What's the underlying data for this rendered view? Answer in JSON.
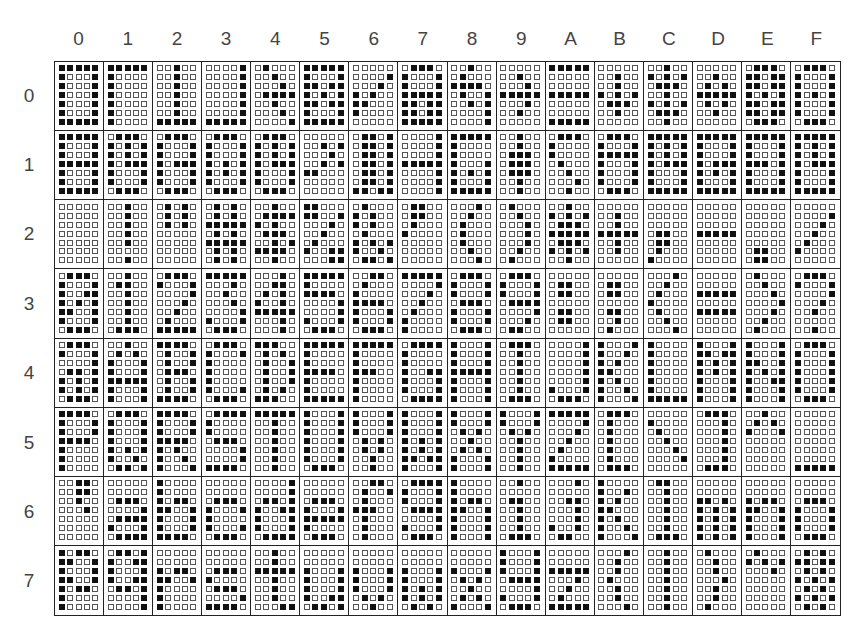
{
  "column_headers": [
    "0",
    "1",
    "2",
    "3",
    "4",
    "5",
    "6",
    "7",
    "8",
    "9",
    "A",
    "B",
    "C",
    "D",
    "E",
    "F"
  ],
  "row_headers": [
    "0",
    "1",
    "2",
    "3",
    "4",
    "5",
    "6",
    "7"
  ],
  "colors": {
    "dot_on": "#111111",
    "dot_off": "#ffffff",
    "grid_line": "#222222"
  },
  "matrix_size": {
    "cols": 5,
    "rows": 7
  },
  "cells": [
    [
      [
        "11111",
        "10001",
        "10001",
        "10001",
        "10001",
        "10001",
        "11111"
      ],
      [
        "11111",
        "10000",
        "10000",
        "10000",
        "10000",
        "10000",
        "10000"
      ],
      [
        "00100",
        "00100",
        "00100",
        "00100",
        "00100",
        "00100",
        "11111"
      ],
      [
        "00001",
        "00001",
        "00001",
        "00001",
        "00001",
        "00001",
        "11111"
      ],
      [
        "01000",
        "00100",
        "00010",
        "01111",
        "00100",
        "00010",
        "00001"
      ],
      [
        "11111",
        "10001",
        "11011",
        "10101",
        "11011",
        "10001",
        "11111"
      ],
      [
        "00000",
        "00001",
        "00010",
        "10100",
        "11000",
        "10000",
        "00000"
      ],
      [
        "01110",
        "10001",
        "10001",
        "11111",
        "11011",
        "11011",
        "11111"
      ],
      [
        "00100",
        "01000",
        "11110",
        "01001",
        "00101",
        "00001",
        "00001"
      ],
      [
        "00000",
        "00100",
        "00010",
        "11111",
        "00010",
        "00100",
        "00000"
      ],
      [
        "11111",
        "00000",
        "00000",
        "11111",
        "00000",
        "00000",
        "11111"
      ],
      [
        "00000",
        "00100",
        "00100",
        "10101",
        "01110",
        "00100",
        "00000"
      ],
      [
        "00100",
        "10101",
        "01110",
        "00100",
        "10101",
        "01110",
        "00100"
      ],
      [
        "00000",
        "00100",
        "01010",
        "11111",
        "01010",
        "00100",
        "00000"
      ],
      [
        "01110",
        "11011",
        "11011",
        "10101",
        "11011",
        "11011",
        "01110"
      ],
      [
        "01110",
        "10001",
        "10001",
        "10101",
        "10001",
        "10001",
        "01110"
      ]
    ],
    [
      [
        "11111",
        "10001",
        "10001",
        "11111",
        "10001",
        "10001",
        "11111"
      ],
      [
        "01110",
        "10101",
        "10101",
        "10111",
        "10001",
        "10001",
        "01110"
      ],
      [
        "01110",
        "10001",
        "10001",
        "10111",
        "10001",
        "10001",
        "01110"
      ],
      [
        "01110",
        "10001",
        "10001",
        "10101",
        "10101",
        "10001",
        "01110"
      ],
      [
        "01110",
        "10101",
        "10101",
        "10111",
        "10001",
        "10001",
        "01110"
      ],
      [
        "00000",
        "00101",
        "00010",
        "00101",
        "11000",
        "00000",
        "00000"
      ],
      [
        "01101",
        "01101",
        "01101",
        "01101",
        "01101",
        "01101",
        "11011"
      ],
      [
        "00001",
        "00001",
        "00001",
        "11111",
        "00001",
        "00001",
        "00001"
      ],
      [
        "11111",
        "10000",
        "10000",
        "10001",
        "10101",
        "10001",
        "11111"
      ],
      [
        "00100",
        "00100",
        "01110",
        "01110",
        "01110",
        "00100",
        "00100"
      ],
      [
        "01110",
        "10000",
        "10000",
        "01000",
        "00100",
        "00010",
        "00100"
      ],
      [
        "01110",
        "10001",
        "11111",
        "10001",
        "10001",
        "10001",
        "01110"
      ],
      [
        "11111",
        "10101",
        "10101",
        "10111",
        "10001",
        "10001",
        "11111"
      ],
      [
        "11111",
        "10001",
        "10001",
        "10111",
        "10101",
        "10001",
        "11111"
      ],
      [
        "11111",
        "10001",
        "10001",
        "11101",
        "10001",
        "10001",
        "11111"
      ],
      [
        "11111",
        "10101",
        "10101",
        "10111",
        "10001",
        "10001",
        "11111"
      ]
    ],
    [
      [
        "00000",
        "00000",
        "00000",
        "00000",
        "00000",
        "00000",
        "00000"
      ],
      [
        "00100",
        "00100",
        "00100",
        "00100",
        "00100",
        "00000",
        "00100"
      ],
      [
        "01010",
        "01010",
        "01010",
        "00000",
        "00000",
        "00000",
        "00000"
      ],
      [
        "01010",
        "01010",
        "11111",
        "01010",
        "11111",
        "01010",
        "01010"
      ],
      [
        "00100",
        "01111",
        "10100",
        "01110",
        "00101",
        "11110",
        "00100"
      ],
      [
        "11000",
        "11001",
        "00010",
        "00100",
        "01000",
        "10011",
        "00011"
      ],
      [
        "01000",
        "10100",
        "10100",
        "01000",
        "10101",
        "10010",
        "01101"
      ],
      [
        "01100",
        "01100",
        "01000",
        "10000",
        "00000",
        "00000",
        "00000"
      ],
      [
        "00010",
        "00100",
        "01000",
        "01000",
        "01000",
        "00100",
        "00010"
      ],
      [
        "01000",
        "00100",
        "00010",
        "00010",
        "00010",
        "00100",
        "01000"
      ],
      [
        "00100",
        "10101",
        "01110",
        "11111",
        "01110",
        "10101",
        "00100"
      ],
      [
        "00000",
        "00100",
        "00100",
        "11111",
        "00100",
        "00100",
        "00000"
      ],
      [
        "00000",
        "00000",
        "00000",
        "01100",
        "01100",
        "01000",
        "10000"
      ],
      [
        "00000",
        "00000",
        "00000",
        "11111",
        "00000",
        "00000",
        "00000"
      ],
      [
        "00000",
        "00000",
        "00000",
        "00000",
        "00000",
        "01100",
        "01100"
      ],
      [
        "00000",
        "00001",
        "00010",
        "00100",
        "01000",
        "10000",
        "00000"
      ]
    ],
    [
      [
        "01110",
        "10001",
        "10011",
        "10101",
        "11001",
        "10001",
        "01110"
      ],
      [
        "00100",
        "01100",
        "00100",
        "00100",
        "00100",
        "00100",
        "01110"
      ],
      [
        "01110",
        "10001",
        "00001",
        "00010",
        "00100",
        "01000",
        "11111"
      ],
      [
        "11111",
        "00010",
        "00100",
        "00010",
        "00001",
        "10001",
        "01110"
      ],
      [
        "00010",
        "00110",
        "01010",
        "10010",
        "11111",
        "00010",
        "00010"
      ],
      [
        "11111",
        "10000",
        "11110",
        "00001",
        "00001",
        "10001",
        "01110"
      ],
      [
        "00110",
        "01000",
        "10000",
        "11110",
        "10001",
        "10001",
        "01110"
      ],
      [
        "11111",
        "00001",
        "00010",
        "00100",
        "01000",
        "10000",
        "10000"
      ],
      [
        "01110",
        "10001",
        "10001",
        "01110",
        "10001",
        "10001",
        "01110"
      ],
      [
        "01110",
        "10001",
        "10001",
        "01111",
        "00001",
        "00010",
        "01100"
      ],
      [
        "00000",
        "01100",
        "01100",
        "00000",
        "01100",
        "01100",
        "00000"
      ],
      [
        "00000",
        "01100",
        "01100",
        "00000",
        "01100",
        "00100",
        "01000"
      ],
      [
        "00010",
        "00100",
        "01000",
        "10000",
        "01000",
        "00100",
        "00010"
      ],
      [
        "00000",
        "00000",
        "11111",
        "00000",
        "11111",
        "00000",
        "00000"
      ],
      [
        "01000",
        "00100",
        "00010",
        "00001",
        "00010",
        "00100",
        "01000"
      ],
      [
        "01110",
        "10001",
        "00001",
        "00010",
        "00100",
        "00000",
        "00100"
      ]
    ],
    [
      [
        "01110",
        "10001",
        "00001",
        "01101",
        "10101",
        "10101",
        "01110"
      ],
      [
        "00100",
        "01010",
        "10001",
        "10001",
        "11111",
        "10001",
        "10001"
      ],
      [
        "11110",
        "01001",
        "01001",
        "01110",
        "01001",
        "01001",
        "11110"
      ],
      [
        "01110",
        "10001",
        "10000",
        "10000",
        "10000",
        "10001",
        "01110"
      ],
      [
        "11100",
        "01010",
        "01001",
        "01001",
        "01001",
        "01010",
        "11100"
      ],
      [
        "11111",
        "10000",
        "10000",
        "11110",
        "10000",
        "10000",
        "11111"
      ],
      [
        "11111",
        "10000",
        "10000",
        "11100",
        "10000",
        "10000",
        "10000"
      ],
      [
        "01111",
        "10000",
        "10000",
        "10011",
        "10001",
        "10001",
        "01111"
      ],
      [
        "10001",
        "10001",
        "10001",
        "11111",
        "10001",
        "10001",
        "10001"
      ],
      [
        "01110",
        "00100",
        "00100",
        "00100",
        "00100",
        "00100",
        "01110"
      ],
      [
        "00001",
        "00001",
        "00001",
        "00001",
        "00001",
        "10001",
        "01110"
      ],
      [
        "10001",
        "10010",
        "10100",
        "11000",
        "10100",
        "10010",
        "10001"
      ],
      [
        "10000",
        "10000",
        "10000",
        "10000",
        "10000",
        "10000",
        "11111"
      ],
      [
        "10001",
        "11011",
        "10101",
        "10101",
        "10001",
        "10001",
        "10001"
      ],
      [
        "10001",
        "10001",
        "11001",
        "10101",
        "10011",
        "10001",
        "10001"
      ],
      [
        "01110",
        "10001",
        "10001",
        "10001",
        "10001",
        "10001",
        "01110"
      ]
    ],
    [
      [
        "11110",
        "10001",
        "10001",
        "11110",
        "10000",
        "10000",
        "10000"
      ],
      [
        "01110",
        "10001",
        "10001",
        "10001",
        "10101",
        "10010",
        "01101"
      ],
      [
        "11110",
        "10001",
        "10001",
        "11110",
        "10100",
        "10010",
        "10001"
      ],
      [
        "01111",
        "10000",
        "10000",
        "01110",
        "00001",
        "00001",
        "11110"
      ],
      [
        "11111",
        "00100",
        "00100",
        "00100",
        "00100",
        "00100",
        "00100"
      ],
      [
        "10001",
        "10001",
        "10001",
        "10001",
        "10001",
        "10001",
        "01110"
      ],
      [
        "10001",
        "10001",
        "10001",
        "01010",
        "01010",
        "00100",
        "00100"
      ],
      [
        "10001",
        "10001",
        "10001",
        "10101",
        "10101",
        "11011",
        "10001"
      ],
      [
        "10001",
        "10001",
        "01010",
        "00100",
        "01010",
        "10001",
        "10001"
      ],
      [
        "10001",
        "10001",
        "01010",
        "00100",
        "00100",
        "00100",
        "00100"
      ],
      [
        "11111",
        "00001",
        "00010",
        "00100",
        "01000",
        "10000",
        "11111"
      ],
      [
        "01110",
        "01000",
        "01000",
        "01000",
        "01000",
        "01000",
        "01110"
      ],
      [
        "00000",
        "10000",
        "01000",
        "00100",
        "00010",
        "00001",
        "00000"
      ],
      [
        "01110",
        "00010",
        "00010",
        "00010",
        "00010",
        "00010",
        "01110"
      ],
      [
        "00100",
        "01010",
        "10001",
        "00000",
        "00000",
        "00000",
        "00000"
      ],
      [
        "00000",
        "00000",
        "00000",
        "00000",
        "00000",
        "00000",
        "11111"
      ]
    ],
    [
      [
        "00110",
        "00110",
        "00100",
        "00010",
        "00000",
        "00000",
        "00000"
      ],
      [
        "00000",
        "00000",
        "01110",
        "00001",
        "01111",
        "10001",
        "01111"
      ],
      [
        "10000",
        "10000",
        "10110",
        "11001",
        "10001",
        "10001",
        "11110"
      ],
      [
        "00000",
        "00000",
        "01110",
        "10001",
        "10000",
        "10001",
        "01110"
      ],
      [
        "00001",
        "00001",
        "01101",
        "10011",
        "10001",
        "10001",
        "01111"
      ],
      [
        "00000",
        "00000",
        "01110",
        "10001",
        "11111",
        "10000",
        "01110"
      ],
      [
        "00110",
        "01001",
        "01000",
        "11100",
        "01000",
        "01000",
        "01000"
      ],
      [
        "01111",
        "10001",
        "10001",
        "01111",
        "00001",
        "10001",
        "01110"
      ],
      [
        "10000",
        "10000",
        "10110",
        "11001",
        "10001",
        "10001",
        "10001"
      ],
      [
        "00100",
        "00000",
        "01100",
        "00100",
        "00100",
        "00100",
        "01110"
      ],
      [
        "00010",
        "00000",
        "00110",
        "00010",
        "00010",
        "10010",
        "01100"
      ],
      [
        "10000",
        "10010",
        "10100",
        "11000",
        "10100",
        "10010",
        "10001"
      ],
      [
        "01100",
        "00100",
        "00100",
        "00100",
        "00100",
        "00100",
        "01110"
      ],
      [
        "00000",
        "00000",
        "11010",
        "10101",
        "10101",
        "10101",
        "10101"
      ],
      [
        "00000",
        "00000",
        "10110",
        "11001",
        "10001",
        "10001",
        "10001"
      ],
      [
        "00000",
        "00000",
        "01110",
        "10001",
        "10001",
        "10001",
        "01110"
      ]
    ],
    [
      [
        "10110",
        "11001",
        "10001",
        "11001",
        "10110",
        "10000",
        "10000"
      ],
      [
        "01101",
        "10011",
        "10001",
        "10011",
        "01101",
        "00001",
        "00001"
      ],
      [
        "00000",
        "00000",
        "10110",
        "11001",
        "10000",
        "10000",
        "10000"
      ],
      [
        "00000",
        "00000",
        "01110",
        "10000",
        "01110",
        "00001",
        "11110"
      ],
      [
        "00100",
        "00100",
        "11111",
        "00100",
        "00100",
        "00100",
        "00011"
      ],
      [
        "00000",
        "00000",
        "10001",
        "10001",
        "10001",
        "10011",
        "01101"
      ],
      [
        "00000",
        "00000",
        "10001",
        "10001",
        "10001",
        "01010",
        "00100"
      ],
      [
        "00000",
        "00000",
        "10001",
        "10001",
        "10101",
        "10101",
        "01010"
      ],
      [
        "00000",
        "00000",
        "10001",
        "01010",
        "00100",
        "01010",
        "10001"
      ],
      [
        "10001",
        "10001",
        "10001",
        "01111",
        "00001",
        "10001",
        "01110"
      ],
      [
        "00000",
        "00000",
        "11111",
        "00010",
        "00100",
        "01000",
        "11111"
      ],
      [
        "00010",
        "00100",
        "00100",
        "01000",
        "00100",
        "00100",
        "00010"
      ],
      [
        "00100",
        "00100",
        "00100",
        "00100",
        "00100",
        "00100",
        "00100"
      ],
      [
        "01000",
        "00100",
        "00100",
        "00010",
        "00100",
        "00100",
        "01000"
      ],
      [
        "01000",
        "10101",
        "00010",
        "00000",
        "00000",
        "00000",
        "00000"
      ],
      [
        "01010",
        "11011",
        "01010",
        "10101",
        "01010",
        "10101",
        "01010"
      ]
    ]
  ]
}
